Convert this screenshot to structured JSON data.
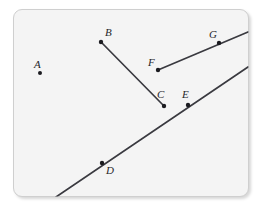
{
  "figure": {
    "canvas": {
      "width": 261,
      "height": 209
    },
    "colors": {
      "page_background": "#ffffff",
      "panel_background": "#f4f4f4",
      "panel_border": "#cfcfcf",
      "stroke": "#3a3a40",
      "point_fill": "#1b1b20",
      "label_text": "#26262a"
    },
    "panel": {
      "x": 13,
      "y": 9,
      "width": 236,
      "height": 188,
      "corner_radius": 9
    },
    "points": [
      {
        "id": "A",
        "label": "A",
        "x": 40,
        "y": 73,
        "label_x": 34,
        "label_y": 59,
        "radius": 2.0
      },
      {
        "id": "B",
        "label": "B",
        "x": 101,
        "y": 42,
        "label_x": 105,
        "label_y": 27,
        "radius": 2.2
      },
      {
        "id": "C",
        "label": "C",
        "x": 164,
        "y": 106,
        "label_x": 157,
        "label_y": 89,
        "radius": 2.2
      },
      {
        "id": "D",
        "label": "D",
        "x": 102,
        "y": 163,
        "label_x": 106,
        "label_y": 165,
        "radius": 2.2
      },
      {
        "id": "E",
        "label": "E",
        "x": 188,
        "y": 105,
        "label_x": 182,
        "label_y": 89,
        "radius": 2.2
      },
      {
        "id": "F",
        "label": "F",
        "x": 158,
        "y": 70,
        "label_x": 148,
        "label_y": 57,
        "radius": 2.2
      },
      {
        "id": "G",
        "label": "G",
        "x": 219,
        "y": 43,
        "label_x": 209,
        "label_y": 29,
        "radius": 2.2
      }
    ],
    "strokes": [
      {
        "id": "segment-BC",
        "kind": "segment",
        "endpoints": [
          "B",
          "C"
        ],
        "x1": 101,
        "y1": 42,
        "x2": 164,
        "y2": 106,
        "width": 1.7
      },
      {
        "id": "ray-FG",
        "kind": "ray",
        "endpoints": [
          "F",
          "G"
        ],
        "x1": 158,
        "y1": 70,
        "x2": 248,
        "y2": 32,
        "width": 1.7
      },
      {
        "id": "line-DE",
        "kind": "line",
        "endpoints": [
          "D",
          "E"
        ],
        "x1": 56,
        "y1": 197,
        "x2": 248,
        "y2": 67,
        "width": 1.7
      }
    ]
  }
}
